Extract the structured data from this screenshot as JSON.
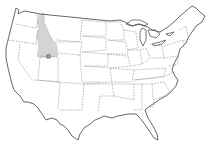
{
  "map": {
    "subject": "United States of America",
    "highlighted_region": {
      "name": "Idaho",
      "fill_color": "#d4d4d4"
    },
    "marker": {
      "shape": "square",
      "stroke_color": "#444444"
    },
    "colors": {
      "background": "#ffffff",
      "outline": "#555555",
      "state_border": "#777777"
    }
  }
}
